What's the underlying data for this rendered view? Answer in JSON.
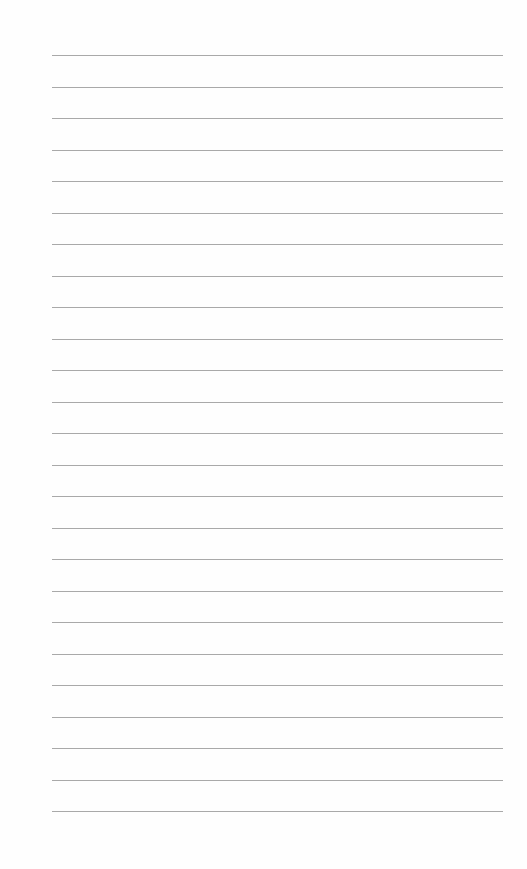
{
  "page": {
    "type": "lined-paper",
    "background": "#fefefe",
    "rule_color": "#9a9a9a",
    "rule_count": 25,
    "rule_left": 52,
    "rule_right": 503,
    "first_rule_y": 55,
    "rule_spacing": 31.5,
    "text": []
  }
}
